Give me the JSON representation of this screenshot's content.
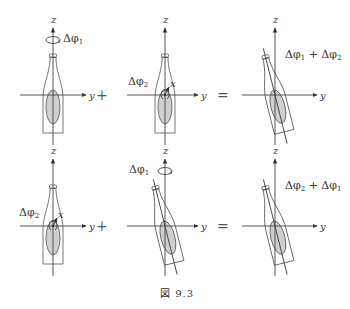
{
  "figure": {
    "caption": "図 9.3",
    "operators": {
      "row1_plus": "+",
      "row1_equals": "=",
      "row2_plus": "+",
      "row2_equals": "="
    },
    "panels": [
      {
        "id": "top-left",
        "axes": {
          "z": "z",
          "y": "y"
        },
        "rotation_label": "Δφ1",
        "rotation_axis": "z",
        "bottle_tilt": "upright"
      },
      {
        "id": "top-middle",
        "axes": {
          "z": "z",
          "y": "y",
          "x": "x"
        },
        "rotation_label": "Δφ2",
        "rotation_axis": "x",
        "bottle_tilt": "upright"
      },
      {
        "id": "top-right",
        "axes": {
          "z": "z",
          "y": "y"
        },
        "result_label": "Δφ1 + Δφ2",
        "bottle_tilt": "tilted"
      },
      {
        "id": "bottom-left",
        "axes": {
          "z": "z",
          "y": "y",
          "x": "x"
        },
        "rotation_label": "Δφ2",
        "rotation_axis": "x",
        "bottle_tilt": "upright"
      },
      {
        "id": "bottom-middle",
        "axes": {
          "z": "z",
          "y": "y"
        },
        "rotation_label": "Δφ1",
        "rotation_axis": "z",
        "bottle_tilt": "tilted"
      },
      {
        "id": "bottom-right",
        "axes": {
          "z": "z",
          "y": "y"
        },
        "result_label": "Δφ2 + Δφ1",
        "bottle_tilt": "tilted"
      }
    ],
    "labels": {
      "z": "z",
      "y": "y",
      "x": "x",
      "dphi": "Δφ",
      "sub1": "1",
      "sub2": "2",
      "plus": "+"
    }
  }
}
